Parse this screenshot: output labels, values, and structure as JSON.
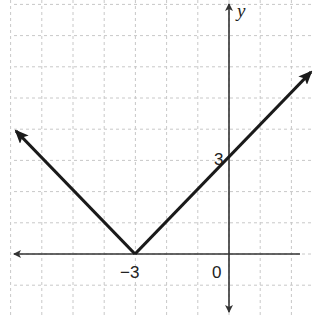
{
  "chart_data": {
    "type": "line",
    "title": "",
    "function": "y = |x + 3|",
    "xlabel": "x",
    "ylabel": "y",
    "xlim": [
      -6.9,
      2.7
    ],
    "ylim": [
      -1.9,
      8.1
    ],
    "grid": true,
    "grid_step": 1,
    "series": [
      {
        "name": "y = |x + 3|",
        "x": [
          -6.9,
          -3,
          2.7
        ],
        "y": [
          3.9,
          0,
          5.7
        ],
        "arrows_at_ends": true
      }
    ],
    "annotations": [
      {
        "text": "-3",
        "at": [
          -3,
          0
        ],
        "kind": "x-intercept / vertex"
      },
      {
        "text": "3",
        "at": [
          0,
          3
        ],
        "kind": "y-intercept"
      },
      {
        "text": "0",
        "at": [
          0,
          0
        ],
        "kind": "origin"
      }
    ]
  },
  "labels": {
    "y_axis": "y",
    "vertex_x": "−3",
    "y_intercept": "3",
    "origin": "0"
  },
  "colors": {
    "axis": "#333333",
    "curve": "#1a1a1a",
    "grid": "#c8c8c8",
    "background": "#ffffff"
  }
}
